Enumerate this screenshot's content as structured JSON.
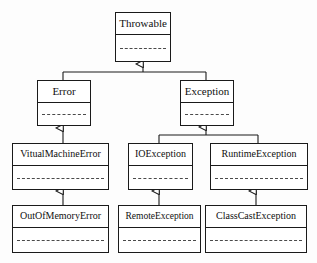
{
  "diagram": {
    "type": "uml-class-diagram",
    "background_color": "#fdfdfd",
    "stroke_color": "#1a1a1a",
    "text_color": "#101010",
    "divider_style": "dashed"
  },
  "classes": [
    {
      "id": "throwable",
      "name": "Throwable",
      "x": 115,
      "y": 12,
      "w": 56,
      "h": 50,
      "font": "fs11"
    },
    {
      "id": "error",
      "name": "Error",
      "x": 37,
      "y": 80,
      "w": 54,
      "h": 46,
      "font": "fs11"
    },
    {
      "id": "exception",
      "name": "Exception",
      "x": 180,
      "y": 80,
      "w": 54,
      "h": 46,
      "font": "fs11"
    },
    {
      "id": "vitual-machine-error",
      "name": "VitualMachineError",
      "x": 12,
      "y": 143,
      "w": 97,
      "h": 47,
      "font": "fs10"
    },
    {
      "id": "io-exception",
      "name": "IOException",
      "x": 128,
      "y": 143,
      "w": 65,
      "h": 47,
      "font": "fs10"
    },
    {
      "id": "runtime-exception",
      "name": "RuntimeException",
      "x": 210,
      "y": 143,
      "w": 98,
      "h": 47,
      "font": "fs10"
    },
    {
      "id": "out-of-memory-error",
      "name": "OutOfMemoryError",
      "x": 12,
      "y": 205,
      "w": 97,
      "h": 48,
      "font": "fs10"
    },
    {
      "id": "remote-exception",
      "name": "RemoteException",
      "x": 118,
      "y": 205,
      "w": 83,
      "h": 48,
      "font": "fs95"
    },
    {
      "id": "class-cast-exception",
      "name": "ClassCastException",
      "x": 205,
      "y": 205,
      "w": 102,
      "h": 48,
      "font": "fs10"
    }
  ],
  "generalizations": [
    {
      "id": "error-to-throwable",
      "child": "Error",
      "parent": "Throwable"
    },
    {
      "id": "exception-to-throwable",
      "child": "Exception",
      "parent": "Throwable"
    },
    {
      "id": "vitualmachineerror-to-error",
      "child": "VitualMachineError",
      "parent": "Error"
    },
    {
      "id": "ioexception-to-exception",
      "child": "IOException",
      "parent": "Exception"
    },
    {
      "id": "runtimeexception-to-exception",
      "child": "RuntimeException",
      "parent": "Exception"
    },
    {
      "id": "outofmemoryerror-to-vme",
      "child": "OutOfMemoryError",
      "parent": "VitualMachineError"
    },
    {
      "id": "remoteexception-to-ioexception",
      "child": "RemoteException",
      "parent": "IOException"
    },
    {
      "id": "classcastexception-to-rte",
      "child": "ClassCastException",
      "parent": "RuntimeException"
    }
  ]
}
